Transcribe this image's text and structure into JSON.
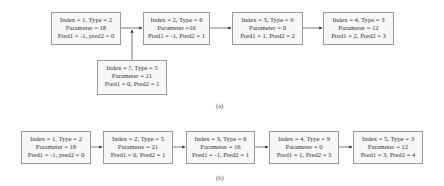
{
  "figure_a": {
    "label": "(a)",
    "nodes": [
      {
        "line1": "Index = 1, Type = 2",
        "line2": "Parameter = 18",
        "line3": "Pred1 = -1, pred2 = 0"
      },
      {
        "line1": "Index = 2, Type = 6",
        "line2": "Parameter =16",
        "line3": "Pred1 = -1, Pred2 = 1"
      },
      {
        "line1": "Index = 3, Type = 9",
        "line2": "Parameter = 0",
        "line3": "Pred1 = 1, Pred2 = 2"
      },
      {
        "line1": "Index = 4, Type = 3",
        "line2": "Parameter = 12",
        "line3": "Pred1 = 2, Pred2 = 3"
      },
      {
        "line1": "Index = ?, Type = 5",
        "line2": "Parameter = 21",
        "line3": "Pred1 = 0, Pred2 = 1"
      }
    ]
  },
  "figure_b": {
    "label": "(b)",
    "nodes": [
      {
        "line1": "Index = 1, Type = 2",
        "line2": "Parameter = 18",
        "line3": "Pred1 = -1, pred2 = 0"
      },
      {
        "line1": "Index = 2, Type = 5",
        "line2": "Parameter = 21",
        "line3": "Pred1 = 0, Pred2 = 1"
      },
      {
        "line1": "Index = 3, Type = 6",
        "line2": "Parameter = 16",
        "line3": "Pred1 = -1, Pred2 = 1"
      },
      {
        "line1": "Index = 4, Type = 9",
        "line2": "Parameter = 0",
        "line3": "Pred1 = 1, Pred2 = 3"
      },
      {
        "line1": "Index = 5, Type = 3",
        "line2": "Parameter = 12",
        "line3": "Pred1 = 3, Pred2 = 4"
      }
    ]
  },
  "colors": {
    "border": "#9a9a9a",
    "fill": "#f7f7f7",
    "edge": "#333333"
  }
}
